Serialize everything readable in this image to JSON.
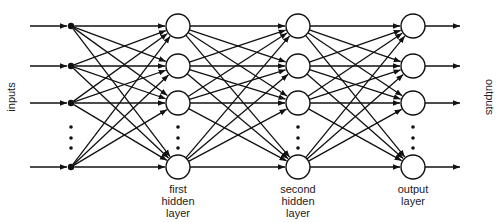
{
  "diagram": {
    "side_labels": {
      "inputs": "inputs",
      "outputs": "outputs"
    },
    "layers": [
      {
        "name": "input",
        "x": 71,
        "type": "dot",
        "label_lines": []
      },
      {
        "name": "first-hidden",
        "x": 178,
        "type": "circle",
        "label_lines": [
          "first",
          "hidden",
          "layer"
        ]
      },
      {
        "name": "second-hidden",
        "x": 298,
        "type": "circle",
        "label_lines": [
          "second",
          "hidden",
          "layer"
        ]
      },
      {
        "name": "output",
        "x": 413,
        "type": "circle",
        "label_lines": [
          "output",
          "layer"
        ]
      }
    ],
    "node_rows_y": [
      26,
      66,
      103,
      167
    ],
    "ellipsis_y": [
      127,
      138,
      148
    ],
    "node_radius": 12,
    "dot_radius": 3.2,
    "stroke_color": "#111111",
    "fill_color": "#ffffff"
  }
}
